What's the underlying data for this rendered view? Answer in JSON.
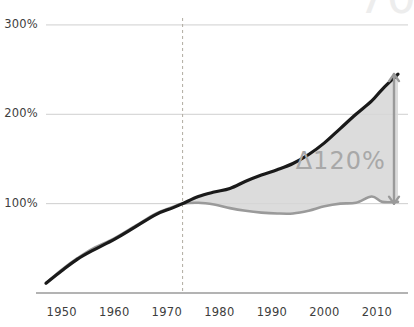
{
  "chart_data": {
    "type": "line",
    "title": "",
    "subtitle": "",
    "xlabel": "",
    "ylabel": "",
    "xlim": [
      1947,
      2014
    ],
    "ylim": [
      0,
      310
    ],
    "ytick_labels": [
      "100%",
      "200%",
      "300%"
    ],
    "ytick_values": [
      100,
      200,
      300
    ],
    "xtick_labels": [
      "1950",
      "1960",
      "1970",
      "1980",
      "1990",
      "2000",
      "2010"
    ],
    "xtick_values": [
      1950,
      1960,
      1970,
      1980,
      1990,
      2000,
      2010
    ],
    "grid": true,
    "grid_axis": "y",
    "legend": "none",
    "reference_line": {
      "type": "vertical-dashed",
      "x": 1973,
      "label": ""
    },
    "annotations": [
      {
        "name": "delta-gap",
        "text": "Δ120%",
        "x": 2005,
        "y": 148,
        "color": "#a8a8a8"
      },
      {
        "name": "gap-arrow",
        "type": "double-headed-vertical-arrow",
        "x": 2014,
        "y_top": 245,
        "y_bottom": 100,
        "color": "#9a9a9a"
      }
    ],
    "fill_between": {
      "upper_series": "productivity",
      "lower_series": "hourly-compensation",
      "color": "#d6d6d6",
      "opacity": 0.85,
      "start_x": 1947
    },
    "series": [
      {
        "name": "productivity",
        "color": "#1a1a1a",
        "width": 3.2,
        "x": [
          1947,
          1950,
          1953,
          1956,
          1960,
          1964,
          1968,
          1971,
          1973,
          1976,
          1979,
          1982,
          1985,
          1988,
          1991,
          1994,
          1997,
          2000,
          2003,
          2006,
          2009,
          2011,
          2014
        ],
        "values": [
          11,
          25,
          38,
          48,
          60,
          74,
          88,
          95,
          100,
          108,
          113,
          117,
          125,
          132,
          138,
          145,
          155,
          168,
          184,
          200,
          215,
          228,
          245
        ]
      },
      {
        "name": "hourly-compensation",
        "color": "#9a9a9a",
        "width": 2.6,
        "x": [
          1947,
          1950,
          1953,
          1956,
          1960,
          1964,
          1968,
          1971,
          1973,
          1976,
          1979,
          1982,
          1985,
          1988,
          1991,
          1994,
          1997,
          2000,
          2003,
          2006,
          2009,
          2011,
          2014
        ],
        "values": [
          11,
          26,
          39,
          50,
          61,
          75,
          89,
          96,
          100,
          101,
          99,
          95,
          92,
          90,
          89,
          89,
          92,
          97,
          100,
          101,
          108,
          102,
          102
        ]
      }
    ]
  },
  "axis": {
    "baseline_color": "#9a9a9a",
    "gridline_color": "#cfcfcf",
    "dashed_line_color": "#b0aca0",
    "tick_text_color": "#3d3d3d"
  },
  "corner": {
    "watermark": "70"
  }
}
